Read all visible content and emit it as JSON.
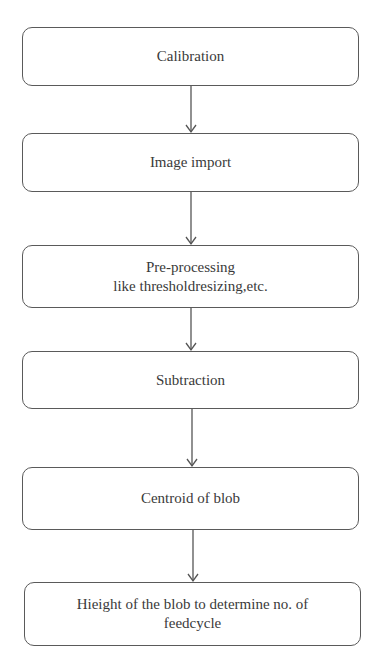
{
  "diagram": {
    "type": "flowchart",
    "direction": "top-to-bottom",
    "colors": {
      "box_border": "#5a5a5a",
      "text": "#3a3a3a",
      "arrow": "#555555",
      "background": "#ffffff"
    },
    "steps": [
      {
        "lines": [
          "Calibration"
        ]
      },
      {
        "lines": [
          "Image import"
        ]
      },
      {
        "lines": [
          "Pre-processing",
          "like thresholdresizing,etc."
        ]
      },
      {
        "lines": [
          "Subtraction"
        ]
      },
      {
        "lines": [
          "Centroid of blob"
        ]
      },
      {
        "lines": [
          "Hieight of the blob to determine no. of",
          "feedcycle"
        ]
      }
    ],
    "edges": [
      {
        "from": 0,
        "to": 1
      },
      {
        "from": 1,
        "to": 2
      },
      {
        "from": 2,
        "to": 3
      },
      {
        "from": 3,
        "to": 4
      },
      {
        "from": 4,
        "to": 5
      }
    ]
  }
}
